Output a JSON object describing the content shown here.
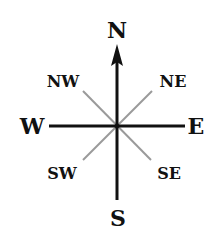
{
  "diagram": {
    "type": "compass-rose",
    "center": [
      117,
      126
    ],
    "colors": {
      "cardinal_line": "#111111",
      "intercardinal_line": "#9a9a9a",
      "label": "#111111",
      "background": "#ffffff"
    },
    "cardinal": {
      "north": "N",
      "south": "S",
      "east": "E",
      "west": "W"
    },
    "intercardinal": {
      "northwest": "NW",
      "northeast": "NE",
      "southwest": "SW",
      "southeast": "SE"
    },
    "arrow_direction": "north"
  }
}
